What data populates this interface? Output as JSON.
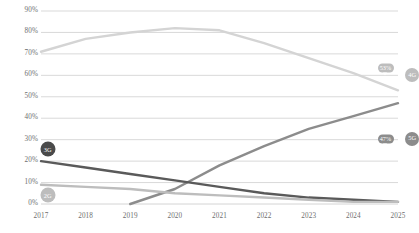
{
  "chart_data": {
    "type": "line",
    "title": "",
    "xlabel": "",
    "ylabel": "",
    "categories": [
      "2017",
      "2018",
      "2019",
      "2020",
      "2021",
      "2022",
      "2023",
      "2024",
      "2025"
    ],
    "x": [
      2017,
      2018,
      2019,
      2020,
      2021,
      2022,
      2023,
      2024,
      2025
    ],
    "ylim": [
      0,
      90
    ],
    "ytick_labels": [
      "0%",
      "10%",
      "20%",
      "30%",
      "40%",
      "50%",
      "60%",
      "70%",
      "80%",
      "90%"
    ],
    "ytick_values": [
      0,
      10,
      20,
      30,
      40,
      50,
      60,
      70,
      80,
      90
    ],
    "grid": true,
    "legend": "none",
    "series": [
      {
        "name": "4G",
        "color": "#d4d4d4",
        "values": [
          71,
          77,
          80,
          82,
          81,
          75,
          68,
          61,
          53
        ]
      },
      {
        "name": "5G",
        "color": "#8c8c8c",
        "values": [
          null,
          null,
          0,
          7,
          18,
          27,
          35,
          41,
          47
        ]
      },
      {
        "name": "3G",
        "color": "#5a5a5a",
        "values": [
          20,
          17,
          14,
          11,
          8,
          5,
          3,
          2,
          1
        ]
      },
      {
        "name": "2G",
        "color": "#bdbdbd",
        "values": [
          9,
          8,
          7,
          5,
          4,
          3,
          2,
          1,
          1
        ]
      }
    ],
    "badges": [
      {
        "label": "3G",
        "x": 2017.15,
        "y": 25.5,
        "color": "#4a4a4a",
        "size": 15
      },
      {
        "label": "2G",
        "x": 2017.15,
        "y": 4.0,
        "color": "#bdbdbd",
        "size": 15
      },
      {
        "label": "4G",
        "x": 2025.32,
        "y": 60.0,
        "color": "#bdbdbd",
        "size": 14
      },
      {
        "label": "5G",
        "x": 2025.32,
        "y": 30.5,
        "color": "#8c8c8c",
        "size": 14
      }
    ],
    "annotations": [
      {
        "label": "53%",
        "x": 2024.72,
        "y": 63.5,
        "color": "#bdbdbd"
      },
      {
        "label": "47%",
        "x": 2024.72,
        "y": 30.5,
        "color": "#8c8c8c"
      }
    ]
  },
  "caption": {
    "text": ""
  }
}
